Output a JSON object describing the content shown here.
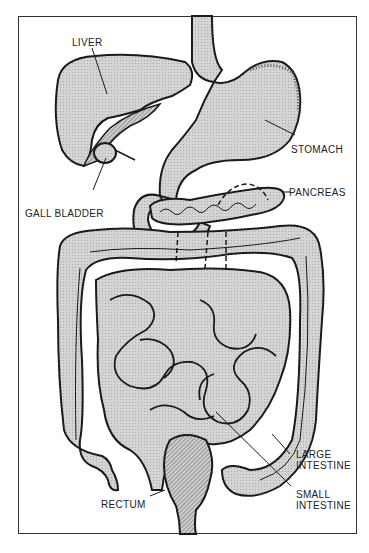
{
  "diagram": {
    "colors": {
      "organ_fill": "#cfcfcf",
      "outline": "#1a1a1a",
      "frame": "#333333",
      "background": "#ffffff"
    },
    "labels": {
      "liver": "LIVER",
      "stomach": "STOMACH",
      "gall_bladder": "GALL BLADDER",
      "pancreas": "PANCREAS",
      "large_intestine_1": "LARGE",
      "large_intestine_2": "INTESTINE",
      "small_intestine_1": "SMALL",
      "small_intestine_2": "INTESTINE",
      "rectum": "RECTUM"
    }
  }
}
